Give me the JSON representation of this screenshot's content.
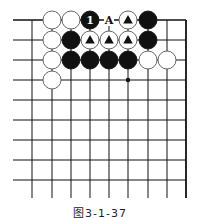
{
  "diagram": {
    "type": "go-board",
    "caption": "图3-1-37",
    "grid": {
      "cols_x": [
        32,
        52,
        71,
        90,
        109,
        128,
        148,
        167,
        186
      ],
      "rows_y": [
        20,
        40,
        60,
        80,
        100,
        120,
        140,
        160,
        180
      ],
      "left_extend_x": 13,
      "bottom_extend_y": 198,
      "right_edge": true,
      "top_edge": true
    },
    "star_points": [
      {
        "col": 5,
        "row": 3
      }
    ],
    "stones": [
      {
        "col": 1,
        "row": 0,
        "color": "white"
      },
      {
        "col": 2,
        "row": 0,
        "color": "white"
      },
      {
        "col": 3,
        "row": 0,
        "color": "black",
        "label": "1"
      },
      {
        "col": 5,
        "row": 0,
        "color": "white",
        "mark": "triangle"
      },
      {
        "col": 6,
        "row": 0,
        "color": "black"
      },
      {
        "col": 1,
        "row": 1,
        "color": "white"
      },
      {
        "col": 2,
        "row": 1,
        "color": "black"
      },
      {
        "col": 3,
        "row": 1,
        "color": "white",
        "mark": "triangle"
      },
      {
        "col": 4,
        "row": 1,
        "color": "white",
        "mark": "triangle"
      },
      {
        "col": 5,
        "row": 1,
        "color": "white",
        "mark": "triangle"
      },
      {
        "col": 6,
        "row": 1,
        "color": "black"
      },
      {
        "col": 1,
        "row": 2,
        "color": "white"
      },
      {
        "col": 2,
        "row": 2,
        "color": "black"
      },
      {
        "col": 3,
        "row": 2,
        "color": "black"
      },
      {
        "col": 4,
        "row": 2,
        "color": "black"
      },
      {
        "col": 5,
        "row": 2,
        "color": "black"
      },
      {
        "col": 6,
        "row": 2,
        "color": "white"
      },
      {
        "col": 7,
        "row": 2,
        "color": "white"
      },
      {
        "col": 1,
        "row": 3,
        "color": "white"
      }
    ],
    "labels": [
      {
        "col": 4,
        "row": 0,
        "text": "A"
      }
    ]
  }
}
